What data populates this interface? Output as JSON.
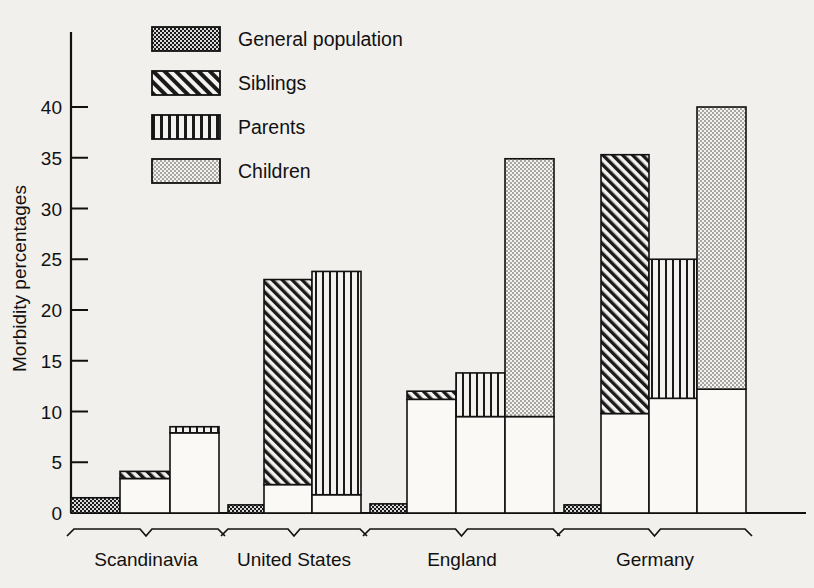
{
  "figure": {
    "partial_caption_top": "",
    "background_color": "#f2f0ec",
    "ink_color": "#111111"
  },
  "axis": {
    "ylabel": "Morbidity percentages",
    "yticks": [
      "0",
      "5",
      "10",
      "15",
      "20",
      "25",
      "30",
      "35",
      "40"
    ],
    "ytick_values": [
      0,
      5,
      10,
      15,
      20,
      25,
      30,
      35,
      40
    ]
  },
  "legend": {
    "items": [
      {
        "label": "General population",
        "pattern": "dark-dotted",
        "swatch_name": "legend-swatch-general-population"
      },
      {
        "label": "Siblings",
        "pattern": "diagonal-hatch",
        "swatch_name": "legend-swatch-siblings"
      },
      {
        "label": "Parents",
        "pattern": "vertical-lines",
        "swatch_name": "legend-swatch-parents"
      },
      {
        "label": "Children",
        "pattern": "light-dotted",
        "swatch_name": "legend-swatch-children"
      }
    ]
  },
  "groups": [
    {
      "label": "Scandinavia"
    },
    {
      "label": "United States"
    },
    {
      "label": "England"
    },
    {
      "label": "Germany"
    }
  ],
  "chart_data": {
    "type": "bar",
    "title": "",
    "subtitle": "",
    "xlabel": "",
    "ylabel": "Morbidity percentages",
    "ylim": [
      0,
      44
    ],
    "yticks": [
      0,
      5,
      10,
      15,
      20,
      25,
      30,
      35,
      40
    ],
    "grid": false,
    "legend_position": "top-center",
    "categories": [
      "Scandinavia",
      "United States",
      "England",
      "Germany"
    ],
    "series": [
      {
        "name": "General population",
        "pattern": "dark-dotted",
        "values": [
          1.5,
          0.8,
          0.9,
          0.8
        ]
      },
      {
        "name": "Siblings",
        "pattern": "diagonal-hatch",
        "values": [
          4.1,
          23.0,
          12.0,
          35.3
        ]
      },
      {
        "name": "Parents",
        "pattern": "vertical-lines",
        "values": [
          8.5,
          23.8,
          13.8,
          25.0
        ]
      },
      {
        "name": "Children",
        "pattern": "light-dotted",
        "values": [
          null,
          null,
          34.9,
          40.0
        ]
      }
    ],
    "bar_base_segments": {
      "note": "Each relative-group bar has a plain white lower segment; the patterned fill occupies the band from base_top to total value.",
      "Scandinavia": {
        "Siblings": 3.4,
        "Parents": 7.9,
        "Children": null
      },
      "United States": {
        "Siblings": 2.8,
        "Parents": 1.8,
        "Children": null
      },
      "England": {
        "Siblings": 11.2,
        "Parents": 9.5,
        "Children": 9.5
      },
      "Germany": {
        "Siblings": 9.8,
        "Parents": 11.3,
        "Children": 12.2
      }
    },
    "bars": [
      {
        "group": "Scandinavia",
        "series": "General population",
        "value": 1.5,
        "base_top": 0
      },
      {
        "group": "Scandinavia",
        "series": "Siblings",
        "value": 4.1,
        "base_top": 3.4
      },
      {
        "group": "Scandinavia",
        "series": "Parents",
        "value": 8.5,
        "base_top": 7.9
      },
      {
        "group": "United States",
        "series": "General population",
        "value": 0.8,
        "base_top": 0
      },
      {
        "group": "United States",
        "series": "Siblings",
        "value": 23.0,
        "base_top": 2.8
      },
      {
        "group": "United States",
        "series": "Parents",
        "value": 23.8,
        "base_top": 1.8
      },
      {
        "group": "England",
        "series": "General population",
        "value": 0.9,
        "base_top": 0
      },
      {
        "group": "England",
        "series": "Siblings",
        "value": 12.0,
        "base_top": 11.2
      },
      {
        "group": "England",
        "series": "Parents",
        "value": 13.8,
        "base_top": 9.5
      },
      {
        "group": "England",
        "series": "Children",
        "value": 34.9,
        "base_top": 9.5
      },
      {
        "group": "Germany",
        "series": "General population",
        "value": 0.8,
        "base_top": 0
      },
      {
        "group": "Germany",
        "series": "Siblings",
        "value": 35.3,
        "base_top": 9.8
      },
      {
        "group": "Germany",
        "series": "Parents",
        "value": 25.0,
        "base_top": 11.3
      },
      {
        "group": "Germany",
        "series": "Children",
        "value": 40.0,
        "base_top": 12.2
      }
    ]
  }
}
